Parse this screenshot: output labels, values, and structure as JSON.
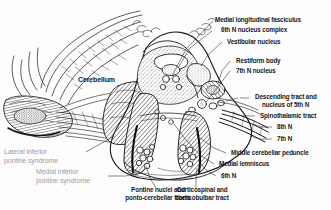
{
  "figure": {
    "background_color": "#fdfdfd",
    "ink_color": "#17181a",
    "muted_ink_color": "#9b9ca0"
  },
  "labels": {
    "cerebellum": "Cerebellum",
    "mlf": "Medial longitudinal fasciculus",
    "sixth_n_nucleus_complex": "6th N nucleus complex",
    "vestibular_nucleus": "Vestibular nucleus",
    "restiform_body": "Restiform body",
    "seventh_n_nucleus": "7th N nucleus",
    "descending_tract_line1": "Descending tract and",
    "descending_tract_line2": "nucleus of 5th N",
    "spinothalamic_tract": "Spinothalamic tract",
    "eighth_n": "8th N",
    "seventh_n": "7th N",
    "middle_cerebellar_peduncle": "Middle cerebellar peduncle",
    "medial_lemniscus": "Medial lemniscus",
    "sixth_n": "6th N",
    "pontine_nuclei_line1": "Pontine nuclei and",
    "pontine_nuclei_line2": "ponto-cerebellar fibers",
    "corticospinal_line1": "Corticospinal and",
    "corticospinal_line2": "corticobulbar tract",
    "lateral_syndrome_line1": "Lateral inferior",
    "lateral_syndrome_line2": "pontine syndrome",
    "medial_syndrome_line1": "Medial inferior",
    "medial_syndrome_line2": "pontine syndrome"
  }
}
